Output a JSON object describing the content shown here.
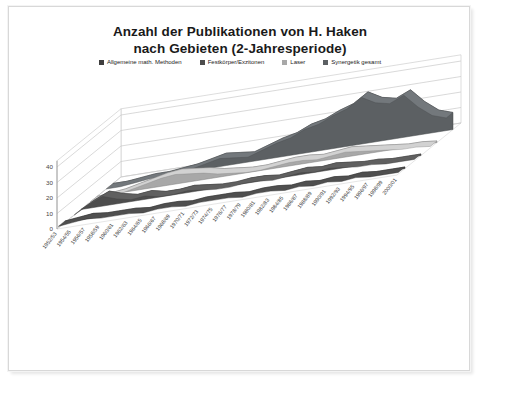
{
  "document": {
    "page_background": "#ffffff",
    "frame_border": "#d8d8d8"
  },
  "title": {
    "line1": "Anzahl der Publikationen von H. Haken",
    "line2": "nach Gebieten (2-Jahresperiode)"
  },
  "legend": {
    "position": "top",
    "items": [
      {
        "label": "Allgemeine math. Methoden",
        "color": "#3f3f3f"
      },
      {
        "label": "Festkörper/Exzitonen",
        "color": "#4d4d4d"
      },
      {
        "label": "Laser",
        "color": "#a8a8a8"
      },
      {
        "label": "Synergetik gesamt",
        "color": "#5c6063"
      }
    ]
  },
  "chart_data": {
    "type": "area",
    "title": "Anzahl der Publikationen von H. Haken nach Gebieten (2-Jahresperiode)",
    "subtitle": "",
    "xlabel": "",
    "ylabel": "",
    "ylim": [
      0,
      40
    ],
    "yticks": [
      0,
      10,
      20,
      30,
      40
    ],
    "grid": true,
    "three_d": true,
    "legend_position": "top",
    "categories": [
      "1952/53",
      "1954/55",
      "1956/57",
      "1958/59",
      "1960/61",
      "1962/63",
      "1964/65",
      "1966/67",
      "1968/69",
      "1970/71",
      "1972/73",
      "1974/75",
      "1976/77",
      "1978/79",
      "1980/81",
      "1982/83",
      "1984/85",
      "1986/87",
      "1988/89",
      "1990/91",
      "1992/93",
      "1994/95",
      "1996/97",
      "1998/99",
      "2000/01"
    ],
    "series": [
      {
        "name": "Allgemeine math. Methoden",
        "color": "#3f3f3f",
        "values": [
          1,
          2,
          3,
          2,
          2,
          2,
          1,
          2,
          2,
          1,
          2,
          2,
          2,
          1,
          2,
          2,
          1,
          2,
          1,
          2,
          1,
          2,
          1,
          1,
          1
        ]
      },
      {
        "name": "Festkörper/Exzitonen",
        "color": "#4d4d4d",
        "values": [
          0,
          5,
          9,
          6,
          4,
          5,
          3,
          3,
          4,
          3,
          2,
          2,
          3,
          3,
          2,
          3,
          4,
          3,
          4,
          3,
          2,
          2,
          1,
          1,
          1
        ]
      },
      {
        "name": "Laser",
        "color": "#a8a8a8",
        "values": [
          0,
          1,
          2,
          4,
          6,
          8,
          9,
          8,
          7,
          5,
          4,
          3,
          3,
          4,
          5,
          5,
          4,
          5,
          6,
          5,
          4,
          3,
          2,
          2,
          1
        ]
      },
      {
        "name": "Synergetik gesamt",
        "color": "#5c6063",
        "values": [
          0,
          0,
          1,
          2,
          2,
          3,
          4,
          6,
          8,
          7,
          6,
          9,
          12,
          14,
          18,
          20,
          24,
          27,
          33,
          28,
          26,
          30,
          21,
          14,
          11
        ]
      }
    ]
  }
}
